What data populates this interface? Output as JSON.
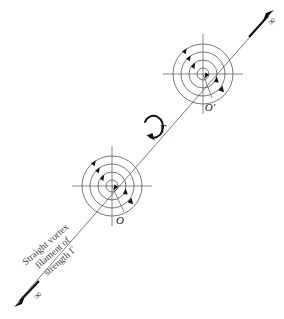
{
  "figure": {
    "background_color": "#ffffff",
    "line_color": "#555555",
    "accent_color": "#111111"
  },
  "caption": {
    "line1": "Straight vortex",
    "line2": "filament of",
    "line3": "strength Γ",
    "rotation_deg": -41
  },
  "circulation": {
    "symbol": "Γ",
    "direction": "counterclockwise"
  },
  "points": [
    {
      "id": "O",
      "label": "O",
      "cx": 112,
      "cy": 186
    },
    {
      "id": "Oprime",
      "label": "O′",
      "cx": 203,
      "cy": 74
    }
  ],
  "infinity": {
    "symbol": "∞",
    "upper_label": "∞",
    "lower_label": "∞"
  },
  "vortex_rings": {
    "radii": [
      6,
      14,
      22,
      30
    ],
    "arrow_count_per_vortex": 6
  },
  "axes": {
    "half_length": 40
  }
}
